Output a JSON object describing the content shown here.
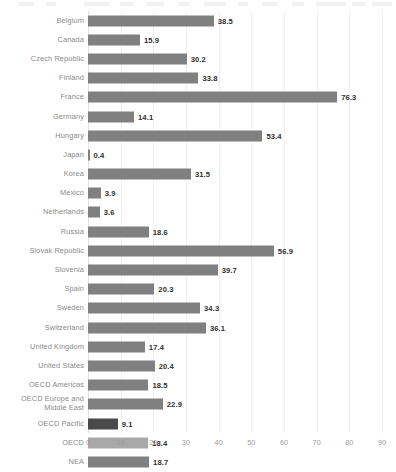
{
  "chart_data": {
    "type": "bar",
    "orientation": "horizontal",
    "title": "",
    "subtitle": "",
    "xlabel": "",
    "ylabel": "",
    "xlim": [
      0,
      90
    ],
    "xticks": [
      0,
      10,
      20,
      30,
      40,
      50,
      60,
      70,
      80,
      90
    ],
    "grid": true,
    "grid_axis": "x",
    "legend": "none",
    "value_labels": true,
    "categories": [
      "Belgium",
      "Canada",
      "Czech Republic",
      "Finland",
      "France",
      "Germany",
      "Hungary",
      "Japan",
      "Korea",
      "Mexico",
      "Netherlands",
      "Russia",
      "Slovak Republic",
      "Slovenia",
      "Spain",
      "Sweden",
      "Switzerland",
      "United Kingdom",
      "United States",
      "OECD Americas",
      "OECD Europe and\nMiddle East",
      "OECD Pacific",
      "OECD",
      "NEA"
    ],
    "values": [
      38.5,
      15.9,
      30.2,
      33.8,
      76.3,
      14.1,
      53.4,
      0.4,
      31.5,
      3.9,
      3.6,
      18.6,
      56.9,
      39.7,
      20.3,
      34.3,
      36.1,
      17.4,
      20.4,
      18.5,
      22.9,
      9.1,
      18.4,
      18.7
    ],
    "value_label_text": [
      "38.5",
      "15.9",
      "30.2",
      "33.8",
      "76.3",
      "14.1",
      "53.4",
      "0.4",
      "31.5",
      "3.9",
      "3.6",
      "18.6",
      "56.9",
      "39.7",
      "20.3",
      "34.3",
      "36.1",
      "17.4",
      "20.4",
      "18.5",
      "22.9",
      "9.1",
      "18.4",
      "18.7"
    ],
    "bar_colors": [
      "#808080",
      "#808080",
      "#808080",
      "#808080",
      "#808080",
      "#808080",
      "#808080",
      "#808080",
      "#808080",
      "#808080",
      "#808080",
      "#808080",
      "#808080",
      "#808080",
      "#808080",
      "#808080",
      "#808080",
      "#808080",
      "#808080",
      "#808080",
      "#808080",
      "#4a4a4a",
      "#a8a8a8",
      "#808080"
    ]
  },
  "colors": {
    "bar_default": "#808080",
    "bar_dark": "#4a4a4a",
    "bar_light": "#a8a8a8",
    "label_text": "#8a8a8a",
    "value_text": "#2f2f2f",
    "tick_text": "#9a9a9a",
    "gridline": "#f0f0f2",
    "axis_line": "#e2e2e4",
    "background": "#ffffff"
  }
}
